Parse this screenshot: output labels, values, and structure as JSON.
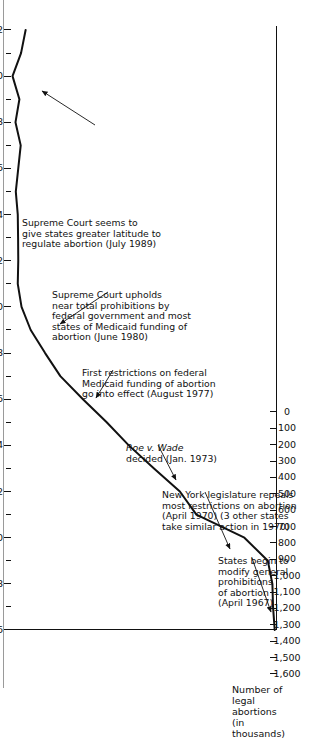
{
  "chart_data": {
    "type": "line",
    "title": "",
    "xlabel": "",
    "ylabel": "Number of\nlegal abortions\n(in thousands)",
    "xlim": [
      1966,
      1992
    ],
    "ylim": [
      0,
      1600
    ],
    "grid": false,
    "legend": null,
    "y_tick_labels": [
      "1,600",
      "1,500",
      "1,400",
      "1,300",
      "1,200",
      "1,100",
      "1,000",
      "900",
      "800",
      "700",
      "600",
      "500",
      "400",
      "300",
      "200",
      "100",
      "0"
    ],
    "y_tick_values": [
      1600,
      1500,
      1400,
      1300,
      1200,
      1100,
      1000,
      900,
      800,
      700,
      600,
      500,
      400,
      300,
      200,
      100,
      0
    ],
    "x_tick_labels": [
      "1966",
      "1968",
      "1970",
      "1972",
      "1974",
      "1976",
      "1978",
      "1980",
      "1982",
      "1984",
      "1986",
      "1988",
      "1990",
      "1992"
    ],
    "x_tick_values": [
      1966,
      1968,
      1970,
      1972,
      1974,
      1976,
      1978,
      1980,
      1982,
      1984,
      1986,
      1988,
      1990,
      1992
    ],
    "x_minor_ticks": [
      1967,
      1969,
      1971,
      1973,
      1975,
      1977,
      1979,
      1981,
      1983,
      1985,
      1987,
      1989,
      1991
    ],
    "series": [
      {
        "name": "Legal abortions (thousands)",
        "x": [
          1966,
          1967,
          1968,
          1969,
          1970,
          1971,
          1972,
          1973,
          1974,
          1975,
          1976,
          1977,
          1978,
          1979,
          1980,
          1981,
          1982,
          1983,
          1984,
          1985,
          1986,
          1987,
          1988,
          1989,
          1990,
          1991,
          1992
        ],
        "values": [
          8,
          18,
          22,
          50,
          193,
          486,
          587,
          745,
          899,
          1034,
          1179,
          1317,
          1410,
          1498,
          1554,
          1577,
          1574,
          1575,
          1577,
          1589,
          1574,
          1559,
          1591,
          1567,
          1609,
          1557,
          1529
        ]
      }
    ],
    "annotations": [
      {
        "id": "states-modify",
        "text": "States begin to\nmodify general\nprohibitions\nof abortion\n(April 1967)",
        "points_to_year": 1967
      },
      {
        "id": "ny-legislature",
        "text": "New York legislature repeals\nmost restrictions on abortion\n(April 1970) (3 other states\ntake similar action in 1970)",
        "points_to_year": 1970
      },
      {
        "id": "roe-v-wade",
        "text_italic": "Roe v. Wade",
        "text": "decided (Jan. 1973)",
        "points_to_year": 1973
      },
      {
        "id": "first-restrictions",
        "text": "First restrictions on federal\nMedicaid funding of abortion\ngo into effect (August 1977)",
        "points_to_year": 1977
      },
      {
        "id": "court-upholds",
        "text": "Supreme Court upholds\nnear total prohibitions by\nfederal government and most\nstates of Medicaid funding of\nabortion (June 1980)",
        "points_to_year": 1980
      },
      {
        "id": "court-latitude",
        "text": "Supreme Court seems to\ngive states greater latitude to\nregulate abortion (July 1989)",
        "points_to_year": 1989
      }
    ],
    "colors": {
      "line": "#111111",
      "axis": "#111111",
      "text": "#111111",
      "background": "#ffffff"
    }
  }
}
